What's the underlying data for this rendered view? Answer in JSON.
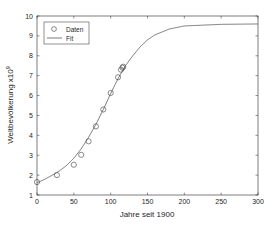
{
  "chart_data": {
    "type": "scatter",
    "title": "",
    "xlabel": "Jahre seit 1900",
    "ylabel": "Weltbevölkerung x10",
    "ylabel_exponent": "9",
    "xlim": [
      0,
      300
    ],
    "ylim": [
      1,
      10
    ],
    "xticks": [
      0,
      50,
      100,
      150,
      200,
      250,
      300
    ],
    "yticks": [
      1,
      2,
      3,
      4,
      5,
      6,
      7,
      8,
      9,
      10
    ],
    "grid": false,
    "legend_position": "upper-left",
    "series": [
      {
        "name": "Daten",
        "kind": "markers",
        "marker": "circle",
        "x": [
          0,
          27,
          50,
          60,
          70,
          80,
          90,
          100,
          110,
          114,
          116,
          117
        ],
        "y": [
          1.65,
          2.0,
          2.52,
          3.02,
          3.7,
          4.45,
          5.3,
          6.13,
          6.92,
          7.3,
          7.4,
          7.45
        ]
      },
      {
        "name": "Fit",
        "kind": "line",
        "model": "logistic",
        "params": {
          "K": 9.6,
          "r": 0.034,
          "t0": 88,
          "offset": 0.0
        },
        "x": [
          0,
          10,
          20,
          30,
          40,
          50,
          60,
          70,
          80,
          90,
          100,
          110,
          120,
          130,
          140,
          150,
          160,
          180,
          200,
          250,
          300
        ],
        "y": [
          1.62,
          1.78,
          1.98,
          2.2,
          2.48,
          2.85,
          3.32,
          3.9,
          4.55,
          5.3,
          6.1,
          6.85,
          7.5,
          8.0,
          8.45,
          8.8,
          9.05,
          9.35,
          9.5,
          9.58,
          9.6
        ]
      }
    ]
  },
  "legend": {
    "items": [
      {
        "label": "Daten",
        "symbol": "circle"
      },
      {
        "label": "Fit",
        "symbol": "line"
      }
    ]
  },
  "colors": {
    "axis": "#262626",
    "series": "#404040",
    "background": "#ffffff"
  }
}
